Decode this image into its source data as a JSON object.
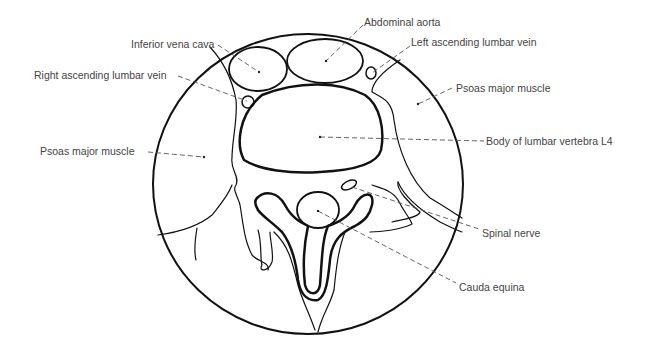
{
  "figure": {
    "colors": {
      "line": "#111111",
      "leader": "#555555",
      "text": "#444444",
      "background": "#ffffff"
    }
  },
  "labels": [
    {
      "id": "inferior-vena-cava",
      "text": "Inferior vena cava"
    },
    {
      "id": "abdominal-aorta",
      "text": "Abdominal aorta"
    },
    {
      "id": "left-ascending-lumbar-vein",
      "text": "Left ascending lumbar vein"
    },
    {
      "id": "right-ascending-lumbar-vein",
      "text": "Right ascending lumbar vein"
    },
    {
      "id": "psoas-major-muscle-right",
      "text": "Psoas major muscle"
    },
    {
      "id": "psoas-major-muscle-left",
      "text": "Psoas major muscle"
    },
    {
      "id": "body-of-lumbar-vertebra-l4",
      "text": "Body of lumbar vertebra L4"
    },
    {
      "id": "spinal-nerve",
      "text": "Spinal nerve"
    },
    {
      "id": "cauda-equina",
      "text": "Cauda equina"
    }
  ]
}
